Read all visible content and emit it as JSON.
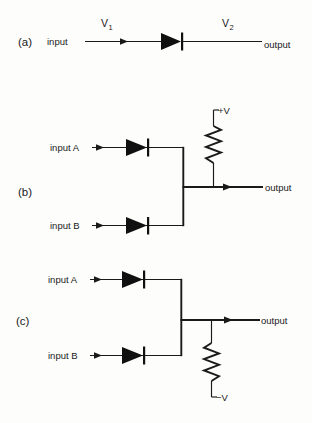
{
  "figure": {
    "background_color": "#fdfdfc",
    "ink_color": "#1a1a1a"
  },
  "panels": [
    {
      "id": "a",
      "label": "(a)",
      "description": "single diode between input and output",
      "input_label": "input",
      "output_label": "output",
      "voltage_in": "V",
      "voltage_in_sub": "1",
      "voltage_out": "V",
      "voltage_out_sub": "2",
      "components": [
        "diode"
      ]
    },
    {
      "id": "b",
      "label": "(b)",
      "description": "diode OR gate with pull-up resistor to positive supply",
      "input_a_label": "input A",
      "input_b_label": "input B",
      "output_label": "output",
      "supply_label": "+V",
      "components": [
        "diode",
        "diode",
        "resistor"
      ]
    },
    {
      "id": "c",
      "label": "(c)",
      "description": "diode AND gate with pull-down resistor to negative supply",
      "input_a_label": "input A",
      "input_b_label": "input B",
      "output_label": "output",
      "supply_label": "−V",
      "components": [
        "diode",
        "diode",
        "resistor"
      ]
    }
  ]
}
